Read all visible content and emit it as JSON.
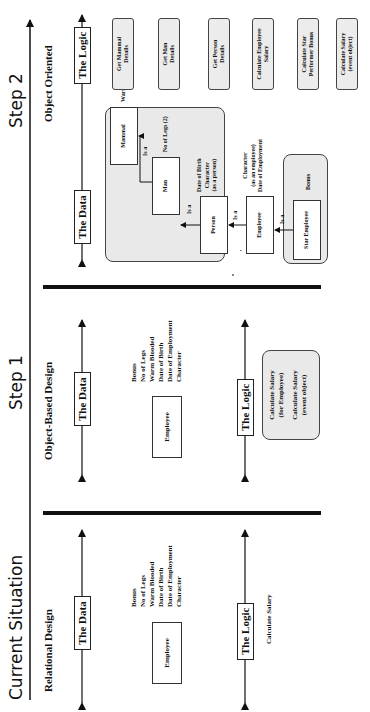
{
  "timeline": {
    "stages": [
      {
        "title": "Current Situation",
        "subtitle": "Relational Design"
      },
      {
        "title": "Step 1",
        "subtitle": "Object-Based Design"
      },
      {
        "title": "Step 2",
        "subtitle": "Object Oriented"
      }
    ]
  },
  "axes": {
    "data_label": "The Data",
    "logic_label": "The Logic"
  },
  "current": {
    "entity": "Employee",
    "attributes": [
      "Bonus",
      "No of Legs",
      "Warm Blooded",
      "Date of Birth",
      "Date of Employment",
      "Character"
    ],
    "logic": "Calculate Salary"
  },
  "step1": {
    "entity": "Employee",
    "attributes": [
      "Bonus",
      "No of Legs",
      "Warm Blooded",
      "Date of Birth",
      "Date of Employment",
      "Character"
    ],
    "methods": [
      "Calculate Salary (for Employee)",
      "Calculate Salary (event object)"
    ],
    "methods_lines": [
      [
        "Calculate Salary",
        "(for Employee)"
      ],
      [
        "Calculate Salary",
        "(event object)"
      ]
    ]
  },
  "step2": {
    "classes": [
      {
        "name": "Mammal",
        "attributes": [
          "Warm Blooded (Y)"
        ]
      },
      {
        "name": "Man",
        "attributes": [
          "No of Legs (2)"
        ]
      },
      {
        "name": "Person",
        "attributes": [
          "Date of Birth",
          "Character",
          "(as a person)"
        ]
      },
      {
        "name": "Employee",
        "attributes": [
          "Character",
          "(as an employee)",
          "Date of Employment"
        ]
      },
      {
        "name": "Star Employee",
        "attributes": [
          "Bonus"
        ]
      }
    ],
    "relation_label": "Is a",
    "methods": [
      [
        "Get Mammal",
        "Details"
      ],
      [
        "Get Man",
        "Details"
      ],
      [
        "Get Person",
        "Details"
      ],
      [
        "Calculate Employee",
        "Salary"
      ],
      [
        "Calculate Star",
        "Performer Bonus"
      ],
      [
        "Calculate Salary",
        "(event object)"
      ]
    ]
  }
}
